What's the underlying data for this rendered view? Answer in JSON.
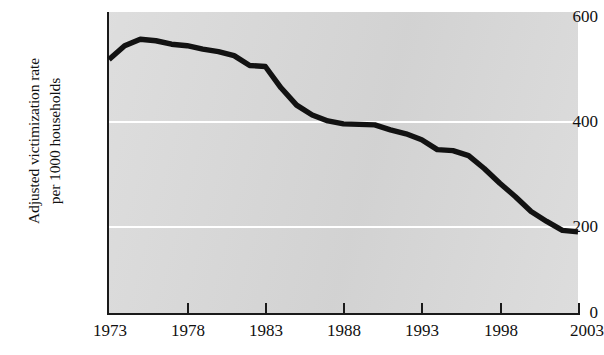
{
  "chart_data": {
    "type": "line",
    "title": "",
    "xlabel": "",
    "ylabel": "Adjusted victimization rate\nper 1000 households",
    "xlim": [
      1973,
      2003
    ],
    "ylim": [
      0,
      600
    ],
    "grid": true,
    "gridlines_y": [
      200,
      400
    ],
    "legend": "none",
    "x_ticks": [
      1973,
      1978,
      1983,
      1988,
      1993,
      1998,
      2003
    ],
    "y_ticks": [
      0,
      200,
      400,
      600
    ],
    "x_tick_labels": [
      "1973",
      "1978",
      "1983",
      "1988",
      "1993",
      "1998",
      "2003"
    ],
    "y_tick_labels": [
      "0",
      "200",
      "400",
      "600"
    ],
    "series": [
      {
        "name": "Adjusted victimization rate per 1000 households",
        "color": "#121212",
        "x": [
          1973,
          1974,
          1975,
          1976,
          1977,
          1978,
          1979,
          1980,
          1981,
          1982,
          1983,
          1984,
          1985,
          1986,
          1987,
          1988,
          1989,
          1990,
          1991,
          1992,
          1993,
          1994,
          1995,
          1996,
          1997,
          1998,
          1999,
          2000,
          2001,
          2002,
          2003
        ],
        "values": [
          512,
          540,
          553,
          550,
          543,
          540,
          533,
          528,
          520,
          500,
          498,
          455,
          420,
          400,
          388,
          382,
          381,
          380,
          370,
          362,
          350,
          330,
          328,
          318,
          292,
          262,
          235,
          205,
          185,
          167,
          164
        ]
      }
    ]
  },
  "axis": {
    "y_title_line1": "Adjusted victimization rate",
    "y_title_line2": "per 1000 households"
  },
  "colors": {
    "plot_background": "#d9d9d9",
    "gridline": "#ffffff",
    "axis": "#1a1a1a",
    "series": "#121212",
    "page_background": "#ffffff"
  }
}
